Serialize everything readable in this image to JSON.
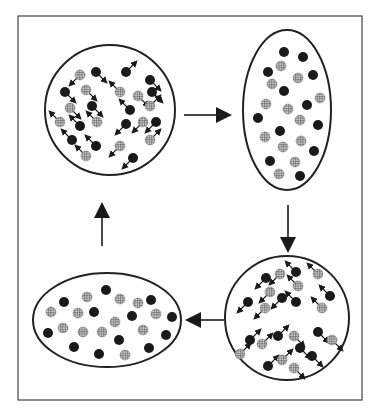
{
  "diagram": {
    "type": "cycle",
    "colors": {
      "stroke": "#222222",
      "dark": "#1a1a1a",
      "hatch_bg": "#cfcfcf",
      "hatch_line": "#555555",
      "frame": "#444444"
    },
    "frame": {
      "x": 18,
      "y": 16,
      "w": 344,
      "h": 384
    },
    "stages": [
      {
        "id": "top-left",
        "shape": "circle",
        "cx": 110,
        "cy": 110,
        "rx": 65,
        "ry": 65,
        "state": "moving",
        "particles": [
          [
            80,
            75,
            "h",
            2
          ],
          [
            96,
            72,
            "d",
            1
          ],
          [
            126,
            72,
            "d",
            0
          ],
          [
            150,
            80,
            "d",
            1
          ],
          [
            65,
            92,
            "d",
            1
          ],
          [
            86,
            90,
            "h",
            1
          ],
          [
            120,
            92,
            "h",
            3
          ],
          [
            138,
            96,
            "h",
            1
          ],
          [
            152,
            92,
            "d",
            1
          ],
          [
            70,
            108,
            "h",
            1
          ],
          [
            92,
            106,
            "d",
            1
          ],
          [
            130,
            110,
            "d",
            3
          ],
          [
            150,
            106,
            "h",
            0
          ],
          [
            60,
            122,
            "h",
            3
          ],
          [
            80,
            126,
            "d",
            3
          ],
          [
            97,
            122,
            "h",
            3
          ],
          [
            126,
            124,
            "d",
            2
          ],
          [
            143,
            122,
            "h",
            2
          ],
          [
            156,
            122,
            "d",
            2
          ],
          [
            72,
            140,
            "d",
            3
          ],
          [
            96,
            146,
            "d",
            3
          ],
          [
            120,
            146,
            "h",
            2
          ],
          [
            150,
            140,
            "h",
            0
          ],
          [
            86,
            156,
            "h",
            3
          ],
          [
            133,
            158,
            "d",
            2
          ]
        ]
      },
      {
        "id": "top-right",
        "shape": "ellipse",
        "cx": 287,
        "cy": 110,
        "rx": 44,
        "ry": 80,
        "state": "still",
        "particles": [
          [
            284,
            52,
            "d"
          ],
          [
            303,
            57,
            "d"
          ],
          [
            281,
            66,
            "h"
          ],
          [
            268,
            72,
            "d"
          ],
          [
            298,
            78,
            "h"
          ],
          [
            313,
            75,
            "d"
          ],
          [
            272,
            84,
            "h"
          ],
          [
            284,
            91,
            "d"
          ],
          [
            320,
            98,
            "h"
          ],
          [
            266,
            104,
            "h"
          ],
          [
            288,
            109,
            "h"
          ],
          [
            307,
            105,
            "d"
          ],
          [
            258,
            118,
            "d"
          ],
          [
            300,
            120,
            "h"
          ],
          [
            318,
            125,
            "d"
          ],
          [
            280,
            131,
            "d"
          ],
          [
            265,
            137,
            "h"
          ],
          [
            301,
            141,
            "h"
          ],
          [
            283,
            147,
            "h"
          ],
          [
            314,
            151,
            "d"
          ],
          [
            270,
            161,
            "d"
          ],
          [
            295,
            162,
            "h"
          ],
          [
            279,
            174,
            "h"
          ],
          [
            300,
            176,
            "d"
          ]
        ]
      },
      {
        "id": "bottom-right",
        "shape": "circle",
        "cx": 287,
        "cy": 318,
        "rx": 62,
        "ry": 62,
        "state": "moving",
        "particles": [
          [
            266,
            278,
            "d",
            2
          ],
          [
            280,
            274,
            "h",
            2
          ],
          [
            296,
            272,
            "d",
            3
          ],
          [
            318,
            274,
            "h",
            3
          ],
          [
            270,
            292,
            "h",
            2
          ],
          [
            298,
            286,
            "h",
            3
          ],
          [
            282,
            298,
            "d",
            2
          ],
          [
            330,
            296,
            "d",
            3
          ],
          [
            248,
            302,
            "d",
            2
          ],
          [
            265,
            308,
            "h",
            2
          ],
          [
            296,
            302,
            "d",
            3
          ],
          [
            322,
            308,
            "h",
            3
          ],
          [
            250,
            340,
            "d",
            0
          ],
          [
            262,
            344,
            "h",
            0
          ],
          [
            278,
            336,
            "d",
            0
          ],
          [
            294,
            336,
            "h",
            1
          ],
          [
            318,
            332,
            "d",
            1
          ],
          [
            332,
            340,
            "h",
            1
          ],
          [
            240,
            354,
            "h",
            0
          ],
          [
            268,
            366,
            "d",
            0
          ],
          [
            282,
            360,
            "h",
            0
          ],
          [
            300,
            348,
            "d",
            1
          ],
          [
            312,
            356,
            "d",
            1
          ],
          [
            294,
            368,
            "h",
            1
          ]
        ]
      },
      {
        "id": "bottom-left",
        "shape": "ellipse",
        "cx": 107,
        "cy": 320,
        "rx": 74,
        "ry": 47,
        "state": "still",
        "particles": [
          [
            106,
            290,
            "d"
          ],
          [
            87,
            297,
            "h"
          ],
          [
            64,
            302,
            "d"
          ],
          [
            120,
            299,
            "h"
          ],
          [
            138,
            303,
            "h"
          ],
          [
            151,
            300,
            "d"
          ],
          [
            51,
            312,
            "h"
          ],
          [
            78,
            313,
            "h"
          ],
          [
            94,
            312,
            "d"
          ],
          [
            132,
            316,
            "d"
          ],
          [
            156,
            314,
            "h"
          ],
          [
            172,
            317,
            "d"
          ],
          [
            115,
            322,
            "h"
          ],
          [
            48,
            333,
            "d"
          ],
          [
            63,
            328,
            "h"
          ],
          [
            83,
            332,
            "h"
          ],
          [
            102,
            332,
            "h"
          ],
          [
            143,
            330,
            "h"
          ],
          [
            166,
            335,
            "d"
          ],
          [
            119,
            340,
            "d"
          ],
          [
            74,
            347,
            "d"
          ],
          [
            99,
            354,
            "d"
          ],
          [
            125,
            355,
            "h"
          ],
          [
            149,
            348,
            "d"
          ]
        ]
      }
    ],
    "arrows": [
      {
        "id": "arrow-right",
        "from": "top-left",
        "to": "top-right",
        "x1": 184,
        "y1": 115,
        "x2": 232,
        "y2": 115
      },
      {
        "id": "arrow-down",
        "from": "top-right",
        "to": "bottom-right",
        "x1": 288,
        "y1": 205,
        "x2": 288,
        "y2": 253
      },
      {
        "id": "arrow-left",
        "from": "bottom-right",
        "to": "bottom-left",
        "x1": 224,
        "y1": 320,
        "x2": 185,
        "y2": 320
      },
      {
        "id": "arrow-up",
        "from": "bottom-left",
        "to": "top-left",
        "x1": 102,
        "y1": 246,
        "x2": 102,
        "y2": 202
      }
    ],
    "legend_semantics": {
      "d": "dark particle",
      "h": "hatched particle",
      "direction": "0=NE,1=SE? see arrows on moving particles"
    }
  }
}
